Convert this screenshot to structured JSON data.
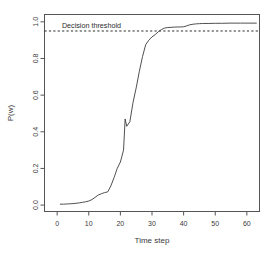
{
  "figure": {
    "background": "#ffffff",
    "line_color": "#3c3c3c",
    "axis_color": "#555555",
    "threshold_color": "#2b2b2b"
  },
  "chart_data": {
    "type": "line",
    "title": "",
    "subtitle": "",
    "xlabel": "Time step",
    "ylabel": "P(w)",
    "xlim": [
      -4,
      64
    ],
    "ylim": [
      -0.035,
      1.04
    ],
    "grid": false,
    "legend": null,
    "xticks": [
      0,
      10,
      20,
      30,
      40,
      50,
      60
    ],
    "xtick_labels": [
      "0",
      "10",
      "20",
      "30",
      "40",
      "50",
      "60"
    ],
    "yticks": [
      0.0,
      0.2,
      0.4,
      0.6,
      0.8,
      1.0
    ],
    "ytick_labels": [
      "0.0",
      "0.2",
      "0.4",
      "0.6",
      "0.8",
      "1.0"
    ],
    "annotations": [
      {
        "name": "decision-threshold-label",
        "text": "Decision threshold",
        "x": 1.5,
        "y": 0.985
      }
    ],
    "threshold": {
      "name": "decision-threshold-line",
      "value": 0.95,
      "style": "dashed",
      "label": "Decision threshold"
    },
    "series": [
      {
        "name": "P(w)",
        "x": [
          1,
          2,
          3,
          4,
          5,
          6,
          7,
          8,
          9,
          10,
          11,
          12,
          13,
          14,
          15,
          16,
          17,
          18,
          19,
          20,
          21,
          21.5,
          22,
          23,
          24,
          25,
          26,
          27,
          28,
          29,
          30,
          31,
          32,
          33,
          34,
          35,
          36,
          37,
          38,
          39,
          40,
          41,
          42,
          43,
          44,
          45,
          46,
          48,
          50,
          52,
          55,
          58,
          61,
          63
        ],
        "values": [
          0.005,
          0.005,
          0.006,
          0.007,
          0.008,
          0.01,
          0.012,
          0.015,
          0.018,
          0.022,
          0.03,
          0.042,
          0.055,
          0.062,
          0.068,
          0.072,
          0.105,
          0.15,
          0.2,
          0.235,
          0.3,
          0.47,
          0.43,
          0.455,
          0.56,
          0.64,
          0.73,
          0.81,
          0.875,
          0.9,
          0.918,
          0.93,
          0.946,
          0.958,
          0.966,
          0.969,
          0.97,
          0.971,
          0.972,
          0.972,
          0.973,
          0.978,
          0.984,
          0.987,
          0.989,
          0.99,
          0.991,
          0.991,
          0.992,
          0.992,
          0.993,
          0.993,
          0.993,
          0.993
        ]
      }
    ]
  }
}
